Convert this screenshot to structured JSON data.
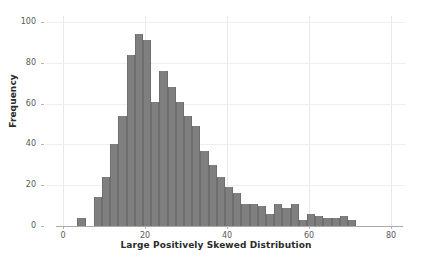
{
  "chart_data": {
    "type": "bar",
    "chart_subtype": "histogram",
    "title": "",
    "xlabel": "Large Positively Skewed Distribution",
    "ylabel": "Frequency",
    "xlim": [
      -2,
      80
    ],
    "ylim": [
      0,
      104
    ],
    "xticks": [
      0,
      20,
      40,
      60,
      80
    ],
    "yticks": [
      0,
      20,
      40,
      60,
      80,
      100
    ],
    "grid": true,
    "legend": "none",
    "bar_color": "#7f7f7f",
    "bar_edge_color": "#6e6e6e",
    "bin_width": 2,
    "bin_starts": [
      3.5,
      7.5,
      9.5,
      11.5,
      13.5,
      15.5,
      17.5,
      19.5,
      21.5,
      23.5,
      25.5,
      27.5,
      29.5,
      31.5,
      33.5,
      35.5,
      37.5,
      39.5,
      41.5,
      43.5,
      45.5,
      47.5,
      49.5,
      51.5,
      53.5,
      55.5,
      57.5,
      59.5,
      61.5,
      63.5,
      65.5,
      67.5,
      69.5
    ],
    "categories": [
      "3.5",
      "7.5",
      "9.5",
      "11.5",
      "13.5",
      "15.5",
      "17.5",
      "19.5",
      "21.5",
      "23.5",
      "25.5",
      "27.5",
      "29.5",
      "31.5",
      "33.5",
      "35.5",
      "37.5",
      "39.5",
      "41.5",
      "43.5",
      "45.5",
      "47.5",
      "49.5",
      "51.5",
      "53.5",
      "55.5",
      "57.5",
      "59.5",
      "61.5",
      "63.5",
      "65.5",
      "67.5",
      "69.5"
    ],
    "values": [
      4,
      14,
      24,
      40,
      54,
      84,
      94,
      91,
      61,
      76,
      68,
      61,
      54,
      49,
      37,
      30,
      24,
      19,
      16,
      11,
      11,
      10,
      6,
      11,
      9,
      11,
      3,
      6,
      5,
      4,
      4,
      5,
      3
    ],
    "values_label": "Frequency"
  },
  "axes": {
    "y_tick_labels": [
      "0",
      "20",
      "40",
      "60",
      "80",
      "100"
    ],
    "x_tick_labels": [
      "0",
      "20",
      "40",
      "60",
      "80"
    ],
    "y_title": "Frequency",
    "x_title": "Large Positively Skewed Distribution"
  }
}
